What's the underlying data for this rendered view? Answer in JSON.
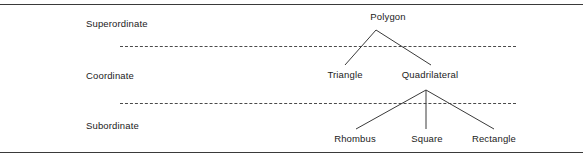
{
  "figure": {
    "type": "hierarchy-diagram",
    "title": "",
    "levels": [
      {
        "key": "superordinate",
        "label": "Superordinate"
      },
      {
        "key": "coordinate",
        "label": "Coordinate"
      },
      {
        "key": "subordinate",
        "label": "Subordinate"
      }
    ],
    "nodes": {
      "polygon": "Polygon",
      "triangle": "Triangle",
      "quadrilateral": "Quadrilateral",
      "rhombus": "Rhombus",
      "square": "Square",
      "rectangle": "Rectangle"
    },
    "edges": [
      {
        "from": "polygon",
        "to": "triangle"
      },
      {
        "from": "polygon",
        "to": "quadrilateral"
      },
      {
        "from": "quadrilateral",
        "to": "rhombus"
      },
      {
        "from": "quadrilateral",
        "to": "square"
      },
      {
        "from": "quadrilateral",
        "to": "rectangle"
      }
    ],
    "colors": {
      "line": "#3a3a3a",
      "divider": "#4a4a4a",
      "text": "#1b1b1b",
      "background": "#ffffff"
    }
  }
}
